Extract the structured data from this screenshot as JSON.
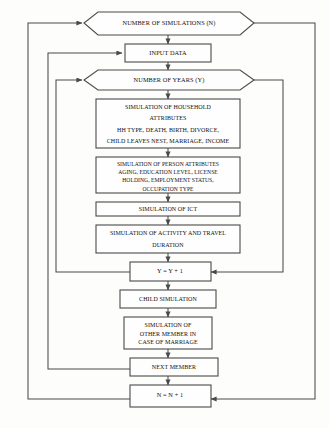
{
  "diagram": {
    "colors": {
      "background": "#fdfdfb",
      "node_fill": "#fefefe",
      "stroke": "#4a4a4a",
      "text": "#111111"
    },
    "nodes": [
      {
        "id": "number-of-simulations",
        "shape": "hexagon",
        "lines": [
          "NUMBER OF SIMULATIONS (N)"
        ]
      },
      {
        "id": "input-data",
        "shape": "rectangle",
        "lines": [
          "INPUT DATA"
        ]
      },
      {
        "id": "number-of-years",
        "shape": "hexagon",
        "lines": [
          "NUMBER OF YEARS (Y)"
        ]
      },
      {
        "id": "simulation-of-household-attributes",
        "shape": "rectangle",
        "lines": [
          "SIMULATION OF HOUSEHOLD",
          "ATTRIBUTES",
          "HH TYPE, DEATH, BIRTH, DIVORCE,",
          "CHILD LEAVES NEST, MARRIAGE,  INCOME"
        ]
      },
      {
        "id": "simulation-of-person-attributes",
        "shape": "rectangle",
        "lines": [
          "SIMULATION OF PERSON ATTRIBUTES",
          "AGING, EDUCATION LEVEL, LICENSE",
          "HOLDING, EMPLOYMENT STATUS,",
          "OCCUPATION TYPE"
        ]
      },
      {
        "id": "simulation-of-ict",
        "shape": "rectangle",
        "lines": [
          "SIMULATION OF ICT"
        ]
      },
      {
        "id": "simulation-of-activity-and-travel-duration",
        "shape": "rectangle",
        "lines": [
          "SIMULATION OF ACTIVITY AND TRAVEL",
          "DURATION"
        ]
      },
      {
        "id": "year-increment",
        "shape": "rectangle",
        "lines": [
          "Y = Y + 1"
        ]
      },
      {
        "id": "child-simulation",
        "shape": "rectangle",
        "lines": [
          "CHILD SIMULATION"
        ]
      },
      {
        "id": "simulation-of-other-member",
        "shape": "rectangle",
        "lines": [
          "SIMULATION OF",
          "OTHER MEMBER IN",
          "CASE OF MARRIAGE"
        ]
      },
      {
        "id": "next-member",
        "shape": "rectangle",
        "lines": [
          "NEXT MEMBER"
        ]
      },
      {
        "id": "simulation-increment",
        "shape": "rectangle",
        "lines": [
          "N = N + 1"
        ]
      }
    ]
  }
}
